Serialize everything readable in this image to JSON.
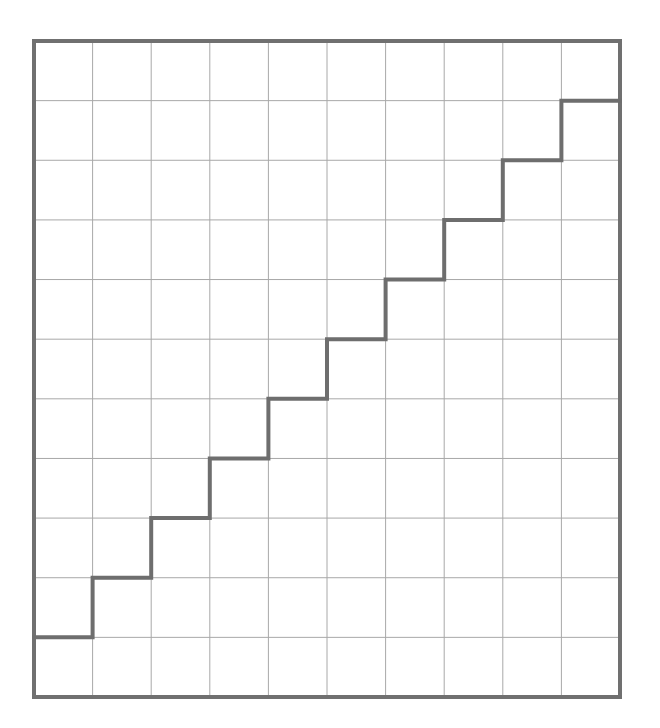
{
  "diagram": {
    "type": "grid-staircase",
    "grid": {
      "columns": 10,
      "rows": 11,
      "left": 34,
      "top": 41,
      "right": 620,
      "bottom": 697
    },
    "staircase": {
      "description": "Step path rising one row per column from bottom-left to top-right",
      "start": {
        "col": 0,
        "rowLine": 10
      },
      "end": {
        "col": 10,
        "rowLine": 1
      },
      "steps": 10
    },
    "colors": {
      "background": "#ffffff",
      "border": "#707070",
      "gridline": "#a8a8a8",
      "staircase": "#6e6e6e"
    },
    "strokes": {
      "border": 4,
      "gridline": 1,
      "staircase": 4
    }
  }
}
